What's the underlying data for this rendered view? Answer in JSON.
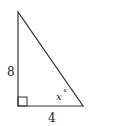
{
  "diagram": {
    "type": "right-triangle",
    "vertices": {
      "top": [
        18,
        12
      ],
      "right_angle": [
        18,
        106
      ],
      "bottom_right": [
        83,
        106
      ]
    },
    "labels": {
      "vertical_side": "8",
      "horizontal_side": "4",
      "angle": "x",
      "angle_unit": "°"
    },
    "right_angle_marker": true,
    "colors": {
      "stroke": "#333333",
      "text": "#222222",
      "background": "#ffffff"
    }
  }
}
